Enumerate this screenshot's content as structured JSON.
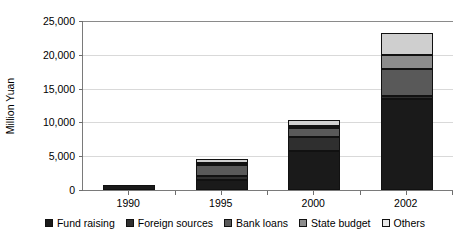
{
  "chart_data": {
    "type": "bar",
    "stacked": true,
    "title": "",
    "subtitle": "",
    "xlabel": "",
    "ylabel": "Million Yuan",
    "categories": [
      "1990",
      "1995",
      "2000",
      "2002"
    ],
    "ylim": [
      0,
      25000
    ],
    "yticks": [
      0,
      5000,
      10000,
      15000,
      20000,
      25000
    ],
    "ytick_labels": [
      "0",
      "5,000",
      "10,000",
      "15,000",
      "20,000",
      "25,000"
    ],
    "grid": true,
    "legend_position": "bottom",
    "series": [
      {
        "name": "Fund raising",
        "color": "#1a1a1a",
        "values": [
          800,
          1500,
          5700,
          13500
        ]
      },
      {
        "name": "Foreign sources",
        "color": "#2f2f2f",
        "values": [
          0,
          550,
          2100,
          400
        ]
      },
      {
        "name": "Bank loans",
        "color": "#595959",
        "values": [
          0,
          1700,
          1400,
          4000
        ]
      },
      {
        "name": "State budget",
        "color": "#8c8c8c",
        "values": [
          0,
          250,
          300,
          2100
        ]
      },
      {
        "name": "Others",
        "color": "#e8e8e8",
        "values": [
          0,
          600,
          800,
          3200
        ]
      }
    ],
    "totals": [
      800,
      4600,
      10300,
      23200
    ]
  },
  "axes": {
    "y_title": "Million Yuan"
  }
}
